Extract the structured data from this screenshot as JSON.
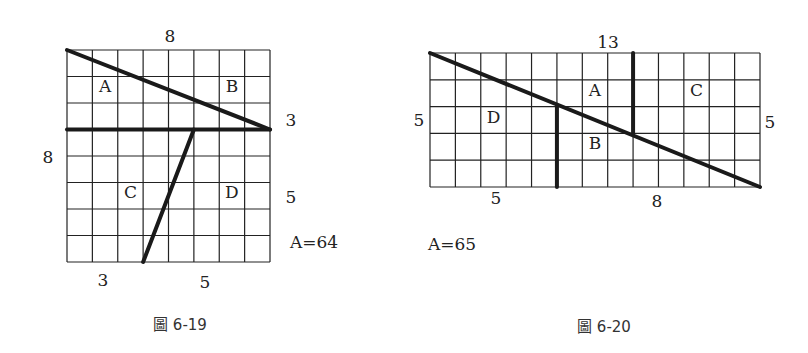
{
  "figures": [
    {
      "id": "fig-6-19",
      "caption": "圖 6-19",
      "grid": {
        "cols": 8,
        "rows": 8,
        "x0": 67,
        "y0": 50,
        "x1": 270,
        "y1": 262
      },
      "cuts": [
        {
          "from": [
            0,
            0
          ],
          "to": [
            8,
            3
          ]
        },
        {
          "from": [
            0,
            3
          ],
          "to": [
            8,
            3
          ]
        },
        {
          "from": [
            5,
            3
          ],
          "to": [
            3,
            8
          ]
        }
      ],
      "region_labels": [
        {
          "text": "A",
          "col": 1.5,
          "row": 1.6
        },
        {
          "text": "B",
          "col": 6.5,
          "row": 1.6
        },
        {
          "text": "C",
          "col": 2.5,
          "row": 5.6
        },
        {
          "text": "D",
          "col": 6.5,
          "row": 5.6
        }
      ],
      "dimension_labels": [
        {
          "text": "8",
          "x": 170,
          "y": 42
        },
        {
          "text": "8",
          "x": 48,
          "y": 163
        },
        {
          "text": "3",
          "x": 291,
          "y": 126
        },
        {
          "text": "5",
          "x": 291,
          "y": 203
        },
        {
          "text": "3",
          "x": 103,
          "y": 286
        },
        {
          "text": "5",
          "x": 205,
          "y": 288
        }
      ],
      "area_label": {
        "text": "A=64",
        "x": 290,
        "y": 248
      },
      "caption_pos": {
        "x": 180,
        "y": 330
      }
    },
    {
      "id": "fig-6-20",
      "caption": "圖 6-20",
      "grid": {
        "cols": 13,
        "rows": 5,
        "x0": 430,
        "y0": 53,
        "x1": 760,
        "y1": 187
      },
      "cuts": [
        {
          "from": [
            0,
            0
          ],
          "to": [
            13,
            5
          ]
        },
        {
          "from": [
            5,
            2
          ],
          "to": [
            5,
            5
          ]
        },
        {
          "from": [
            8,
            0
          ],
          "to": [
            8,
            3
          ]
        }
      ],
      "region_labels": [
        {
          "text": "A",
          "col": 6.5,
          "row": 1.6
        },
        {
          "text": "B",
          "col": 6.5,
          "row": 3.6
        },
        {
          "text": "C",
          "col": 10.5,
          "row": 1.6
        },
        {
          "text": "D",
          "col": 2.5,
          "row": 2.6
        }
      ],
      "dimension_labels": [
        {
          "text": "13",
          "x": 608,
          "y": 48
        },
        {
          "text": "5",
          "x": 419,
          "y": 126
        },
        {
          "text": "5",
          "x": 770,
          "y": 128
        },
        {
          "text": "5",
          "x": 496,
          "y": 204
        },
        {
          "text": "8",
          "x": 657,
          "y": 207
        }
      ],
      "area_label": {
        "text": "A=65",
        "x": 428,
        "y": 250
      },
      "caption_pos": {
        "x": 604,
        "y": 332
      }
    }
  ]
}
